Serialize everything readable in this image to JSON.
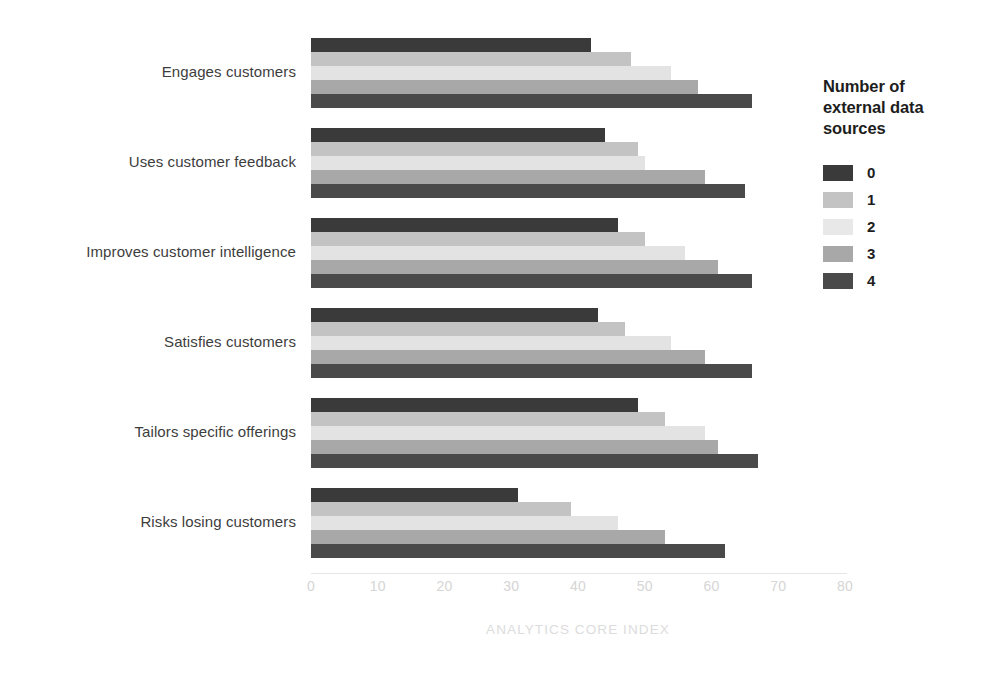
{
  "chart_data": {
    "type": "bar",
    "orientation": "horizontal",
    "title": "",
    "xlabel": "ANALYTICS CORE INDEX",
    "ylabel": "",
    "xlim": [
      0,
      80
    ],
    "xticks": [
      0,
      10,
      20,
      30,
      40,
      50,
      60,
      70,
      80
    ],
    "grid": false,
    "legend_position": "right",
    "legend_title": "Number of external data sources",
    "categories": [
      "Engages customers",
      "Uses customer feedback",
      "Improves customer intelligence",
      "Satisfies customers",
      "Tailors specific offerings",
      "Risks losing customers"
    ],
    "series": [
      {
        "name": "0",
        "color": "#3a3a3a",
        "values": [
          42,
          44,
          46,
          43,
          49,
          31
        ]
      },
      {
        "name": "1",
        "color": "#c3c3c3",
        "values": [
          48,
          49,
          50,
          47,
          53,
          39
        ]
      },
      {
        "name": "2",
        "color": "#e3e3e3",
        "values": [
          54,
          50,
          56,
          54,
          59,
          46
        ]
      },
      {
        "name": "3",
        "color": "#a8a8a8",
        "values": [
          58,
          59,
          61,
          59,
          61,
          53
        ]
      },
      {
        "name": "4",
        "color": "#4a4a4a",
        "values": [
          66,
          65,
          66,
          66,
          67,
          62
        ]
      }
    ]
  },
  "legend": {
    "title_lines": [
      "Number of",
      "external data",
      "sources"
    ],
    "entries": [
      {
        "label": "0",
        "color": "#3a3a3a"
      },
      {
        "label": "1",
        "color": "#c3c3c3"
      },
      {
        "label": "2",
        "color": "#e8e8e8"
      },
      {
        "label": "3",
        "color": "#a8a8a8"
      },
      {
        "label": "4",
        "color": "#4a4a4a"
      }
    ]
  },
  "axis": {
    "title": "ANALYTICS CORE INDEX",
    "tick_labels": [
      "0",
      "10",
      "20",
      "30",
      "40",
      "50",
      "60",
      "70",
      "80"
    ]
  }
}
